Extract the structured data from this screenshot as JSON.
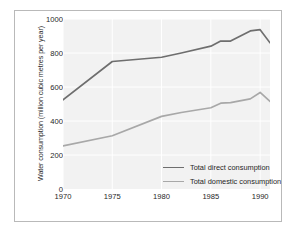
{
  "chart_data": {
    "type": "line",
    "title": "",
    "xlabel": "",
    "ylabel": "Water consumption (million cubic metres per year)",
    "xlim": [
      1970,
      1991
    ],
    "ylim": [
      0,
      1000
    ],
    "grid": true,
    "legend_position": "inside-bottom-right",
    "x_ticks": [
      "1970",
      "1975",
      "1980",
      "1985",
      "1990"
    ],
    "x_tick_values": [
      1970,
      1975,
      1980,
      1985,
      1990
    ],
    "y_ticks": [
      "0",
      "200",
      "400",
      "600",
      "800",
      "1000"
    ],
    "y_tick_values": [
      0,
      200,
      400,
      600,
      800,
      1000
    ],
    "x": [
      1970,
      1975,
      1980,
      1982,
      1985,
      1986,
      1987,
      1989,
      1990,
      1991
    ],
    "series": [
      {
        "name": "Total direct consumption",
        "color": "#6e6e6e",
        "values": [
          525,
          750,
          775,
          800,
          840,
          870,
          870,
          930,
          937,
          860
        ]
      },
      {
        "name": "Total domestic consumption",
        "color": "#a8a8a8",
        "values": [
          253,
          313,
          427,
          450,
          478,
          505,
          508,
          530,
          568,
          515
        ]
      }
    ]
  },
  "style": {
    "plot_background": "#f2f2f2",
    "grid_color": "#ffffff",
    "frame_border": "#b9b9b9",
    "page_background": "#ffffff",
    "tick_text_color": "#1f1f1f"
  }
}
